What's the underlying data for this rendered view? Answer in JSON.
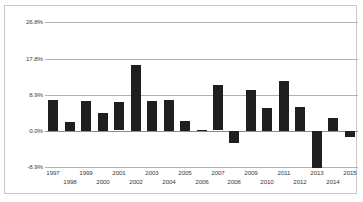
{
  "chart_data": {
    "type": "bar",
    "title": "",
    "subtitle": "",
    "xlabel": "",
    "ylabel": "",
    "categories": [
      "1997",
      "1998",
      "1999",
      "2000",
      "2001",
      "2002",
      "2003",
      "2004",
      "2005",
      "2006",
      "2007",
      "2008",
      "2009",
      "2010",
      "2011",
      "2012",
      "2013",
      "2014",
      "2015"
    ],
    "values": [
      7.6,
      2.3,
      7.3,
      4.4,
      7.0,
      16.2,
      7.3,
      7.6,
      2.4,
      0.3,
      11.2,
      -3.0,
      10.1,
      5.6,
      12.3,
      5.8,
      -9.0,
      3.2,
      -1.4
    ],
    "series": [
      {
        "name": "Annual change",
        "values": [
          7.6,
          2.3,
          7.3,
          4.4,
          7.0,
          16.2,
          7.3,
          7.6,
          2.4,
          0.3,
          11.2,
          -3.0,
          10.1,
          5.6,
          12.3,
          5.8,
          -9.0,
          3.2,
          -1.4
        ]
      }
    ],
    "ytick_labels": [
      "26.8%",
      "17.8%",
      "8.9%",
      "0.0%",
      "-8.9%"
    ],
    "ytick_values": [
      26.8,
      17.8,
      8.9,
      0.0,
      -8.9
    ],
    "ylim": [
      -8.9,
      26.8
    ],
    "grid": true,
    "legend": "none",
    "bar_color": "#1f1f1f",
    "gridline_color": "#b2b2b2",
    "zeroline_color": "#8c8c8c",
    "border_color": "#c9c9c9",
    "background_color": "#ffffff"
  }
}
